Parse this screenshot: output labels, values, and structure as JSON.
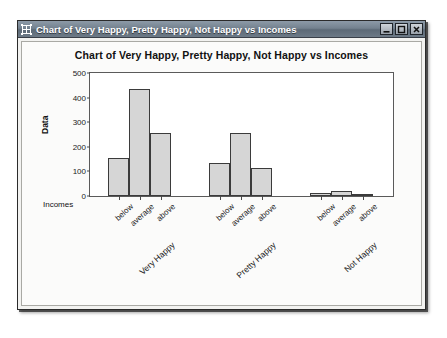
{
  "window": {
    "title": "Chart of Very Happy, Pretty Happy, Not Happy vs Incomes",
    "icon": "grid-app-icon",
    "buttons": {
      "minimize": "Minimize",
      "maximize": "Maximize",
      "close": "Close"
    }
  },
  "chart_data": {
    "type": "bar",
    "title": "Chart of Very Happy, Pretty Happy, Not Happy vs Incomes",
    "xlabel": "Incomes",
    "ylabel": "Data",
    "ylim": [
      0,
      500
    ],
    "yticks": [
      0,
      100,
      200,
      300,
      400,
      500
    ],
    "grid": false,
    "legend": "none",
    "groups": [
      "Very Happy",
      "Pretty Happy",
      "Not Happy"
    ],
    "categories": [
      "below",
      "average",
      "above"
    ],
    "series": [
      {
        "name": "Very Happy",
        "values": [
          155,
          435,
          255
        ]
      },
      {
        "name": "Pretty Happy",
        "values": [
          135,
          255,
          115
        ]
      },
      {
        "name": "Not Happy",
        "values": [
          12,
          20,
          5
        ]
      }
    ]
  }
}
